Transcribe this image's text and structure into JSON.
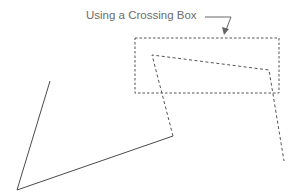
{
  "diagram": {
    "caption": "Using a Crossing Box",
    "colors": {
      "line": "#4a4a4a",
      "dashed": "#555555",
      "caption": "#6b6b6b"
    },
    "crossing_box": {
      "x": 135,
      "y": 38,
      "width": 144,
      "height": 55
    },
    "solid_polyline": [
      [
        50,
        81
      ],
      [
        17,
        190
      ],
      [
        173,
        136
      ]
    ],
    "dashed_polyline": [
      [
        173,
        136
      ],
      [
        152,
        55
      ],
      [
        269,
        70
      ],
      [
        284,
        161
      ]
    ],
    "callout_arrow": {
      "line": [
        [
          205,
          17
        ],
        [
          231,
          17
        ]
      ],
      "head_to": [
        225,
        33
      ]
    }
  }
}
